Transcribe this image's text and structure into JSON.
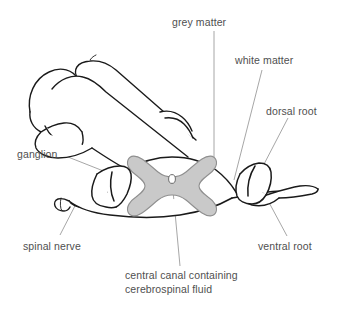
{
  "figure": {
    "background_color": "#ffffff",
    "ink_color": "#1a1a1a",
    "leader_color": "#8c8c8c",
    "grey_matter_fill": "#c9c9c9",
    "grey_matter_stroke": "#8f8f8f",
    "text_color": "#4f4f4f"
  },
  "labels": {
    "grey_matter": "grey matter",
    "white_matter": "white matter",
    "dorsal_root": "dorsal root",
    "ganglion": "ganglion",
    "spinal_nerve": "spinal nerve",
    "ventral_root": "ventral root",
    "central_canal_line1": "central canal containing",
    "central_canal_line2": "cerebrospinal fluid",
    "central_canal_full": "central canal containing\ncerebrospinal fluid"
  },
  "structures": [
    {
      "name": "grey-matter",
      "label": "grey matter",
      "filled": true,
      "fill": "#c9c9c9"
    },
    {
      "name": "white-matter",
      "label": "white matter",
      "filled": false
    },
    {
      "name": "dorsal-root",
      "label": "dorsal root",
      "filled": false
    },
    {
      "name": "ganglion",
      "label": "ganglion",
      "filled": false
    },
    {
      "name": "spinal-nerve",
      "label": "spinal nerve",
      "filled": false
    },
    {
      "name": "ventral-root",
      "label": "ventral root",
      "filled": false
    },
    {
      "name": "central-canal",
      "label": "central canal containing cerebrospinal fluid",
      "filled": false
    }
  ]
}
